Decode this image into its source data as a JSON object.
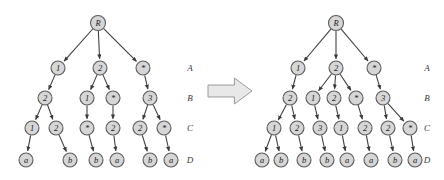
{
  "figure": {
    "type": "diagram",
    "background_color": "#ffffff",
    "node_fill_color": "#d6d6d6",
    "node_stroke_color": "#5a5a5a",
    "edge_color": "#3a3a3a",
    "arrow_fill_color": "#e8e8e8",
    "arrow_stroke_color": "#9a9a9a"
  },
  "transform_arrow": {
    "name": "rightward-block-arrow",
    "x": 208,
    "y": 78,
    "width": 44,
    "height": 26
  },
  "level_labels": {
    "labels": [
      "A",
      "B",
      "C",
      "D"
    ],
    "y": [
      68,
      98,
      128,
      160
    ],
    "left_tree_x": 190,
    "right_tree_x": 427
  },
  "left_tree": {
    "name": "original-tree",
    "nodes": [
      {
        "id": "L0",
        "label": "R",
        "x": 98,
        "y": 23,
        "r": 7.5
      },
      {
        "id": "L1",
        "label": "1",
        "x": 58,
        "y": 68,
        "r": 7
      },
      {
        "id": "L2",
        "label": "2",
        "x": 100,
        "y": 68,
        "r": 7
      },
      {
        "id": "L3",
        "label": "*",
        "x": 143,
        "y": 68,
        "r": 7
      },
      {
        "id": "L4",
        "label": "2",
        "x": 45,
        "y": 98,
        "r": 7
      },
      {
        "id": "L5",
        "label": "1",
        "x": 87,
        "y": 98,
        "r": 7
      },
      {
        "id": "L6",
        "label": "*",
        "x": 113,
        "y": 98,
        "r": 7
      },
      {
        "id": "L7",
        "label": "3",
        "x": 150,
        "y": 98,
        "r": 7
      },
      {
        "id": "L8",
        "label": "1",
        "x": 32,
        "y": 128,
        "r": 7
      },
      {
        "id": "L9",
        "label": "2",
        "x": 56,
        "y": 128,
        "r": 7
      },
      {
        "id": "L10",
        "label": "*",
        "x": 87,
        "y": 128,
        "r": 7
      },
      {
        "id": "L11",
        "label": "2",
        "x": 113,
        "y": 128,
        "r": 7
      },
      {
        "id": "L12",
        "label": "2",
        "x": 140,
        "y": 128,
        "r": 7
      },
      {
        "id": "L13",
        "label": "*",
        "x": 164,
        "y": 128,
        "r": 7
      },
      {
        "id": "L14",
        "label": "a",
        "x": 26,
        "y": 160,
        "r": 7
      },
      {
        "id": "L15",
        "label": "b",
        "x": 70,
        "y": 160,
        "r": 7
      },
      {
        "id": "L16",
        "label": "b",
        "x": 96,
        "y": 160,
        "r": 7
      },
      {
        "id": "L17",
        "label": "a",
        "x": 117,
        "y": 160,
        "r": 7
      },
      {
        "id": "L18",
        "label": "b",
        "x": 150,
        "y": 160,
        "r": 7
      },
      {
        "id": "L19",
        "label": "a",
        "x": 171,
        "y": 160,
        "r": 7
      }
    ],
    "edges": [
      {
        "from": "L0",
        "to": "L1"
      },
      {
        "from": "L0",
        "to": "L2"
      },
      {
        "from": "L0",
        "to": "L3"
      },
      {
        "from": "L1",
        "to": "L4"
      },
      {
        "from": "L2",
        "to": "L5"
      },
      {
        "from": "L2",
        "to": "L6"
      },
      {
        "from": "L3",
        "to": "L7"
      },
      {
        "from": "L4",
        "to": "L8"
      },
      {
        "from": "L4",
        "to": "L9"
      },
      {
        "from": "L5",
        "to": "L10"
      },
      {
        "from": "L6",
        "to": "L11"
      },
      {
        "from": "L7",
        "to": "L12"
      },
      {
        "from": "L7",
        "to": "L13"
      },
      {
        "from": "L8",
        "to": "L14"
      },
      {
        "from": "L9",
        "to": "L15"
      },
      {
        "from": "L10",
        "to": "L16"
      },
      {
        "from": "L11",
        "to": "L17"
      },
      {
        "from": "L12",
        "to": "L18"
      },
      {
        "from": "L13",
        "to": "L19"
      }
    ]
  },
  "right_tree": {
    "name": "transformed-tree",
    "nodes": [
      {
        "id": "R0",
        "label": "R",
        "x": 336,
        "y": 23,
        "r": 7.5
      },
      {
        "id": "R1",
        "label": "1",
        "x": 298,
        "y": 68,
        "r": 7
      },
      {
        "id": "R2",
        "label": "2",
        "x": 336,
        "y": 68,
        "r": 7
      },
      {
        "id": "R3",
        "label": "*",
        "x": 374,
        "y": 68,
        "r": 7
      },
      {
        "id": "R4",
        "label": "2",
        "x": 290,
        "y": 98,
        "r": 7
      },
      {
        "id": "R5",
        "label": "1",
        "x": 313,
        "y": 98,
        "r": 7
      },
      {
        "id": "R6",
        "label": "2",
        "x": 334,
        "y": 98,
        "r": 7
      },
      {
        "id": "R7",
        "label": "*",
        "x": 356,
        "y": 98,
        "r": 7
      },
      {
        "id": "R8",
        "label": "3",
        "x": 383,
        "y": 98,
        "r": 7
      },
      {
        "id": "R9",
        "label": "1",
        "x": 274,
        "y": 128,
        "r": 7
      },
      {
        "id": "R10",
        "label": "2",
        "x": 297,
        "y": 128,
        "r": 7
      },
      {
        "id": "R11",
        "label": "3",
        "x": 320,
        "y": 128,
        "r": 7
      },
      {
        "id": "R12",
        "label": "1",
        "x": 341,
        "y": 128,
        "r": 7
      },
      {
        "id": "R13",
        "label": "2",
        "x": 365,
        "y": 128,
        "r": 7
      },
      {
        "id": "R14",
        "label": "2",
        "x": 388,
        "y": 128,
        "r": 7
      },
      {
        "id": "R15",
        "label": "*",
        "x": 410,
        "y": 128,
        "r": 7
      },
      {
        "id": "R16",
        "label": "a",
        "x": 262,
        "y": 160,
        "r": 7
      },
      {
        "id": "R17",
        "label": "b",
        "x": 281,
        "y": 160,
        "r": 7
      },
      {
        "id": "R18",
        "label": "b",
        "x": 304,
        "y": 160,
        "r": 7
      },
      {
        "id": "R19",
        "label": "b",
        "x": 327,
        "y": 160,
        "r": 7
      },
      {
        "id": "R20",
        "label": "a",
        "x": 347,
        "y": 160,
        "r": 7
      },
      {
        "id": "R21",
        "label": "a",
        "x": 371,
        "y": 160,
        "r": 7
      },
      {
        "id": "R22",
        "label": "b",
        "x": 395,
        "y": 160,
        "r": 7
      },
      {
        "id": "R23",
        "label": "a",
        "x": 415,
        "y": 160,
        "r": 7
      }
    ],
    "edges": [
      {
        "from": "R0",
        "to": "R1"
      },
      {
        "from": "R0",
        "to": "R2"
      },
      {
        "from": "R0",
        "to": "R3"
      },
      {
        "from": "R1",
        "to": "R4"
      },
      {
        "from": "R2",
        "to": "R5"
      },
      {
        "from": "R2",
        "to": "R6"
      },
      {
        "from": "R2",
        "to": "R7"
      },
      {
        "from": "R3",
        "to": "R8"
      },
      {
        "from": "R4",
        "to": "R9"
      },
      {
        "from": "R4",
        "to": "R10"
      },
      {
        "from": "R5",
        "to": "R11"
      },
      {
        "from": "R6",
        "to": "R12"
      },
      {
        "from": "R7",
        "to": "R13"
      },
      {
        "from": "R8",
        "to": "R14"
      },
      {
        "from": "R8",
        "to": "R15"
      },
      {
        "from": "R9",
        "to": "R16"
      },
      {
        "from": "R9",
        "to": "R17"
      },
      {
        "from": "R10",
        "to": "R18"
      },
      {
        "from": "R11",
        "to": "R19"
      },
      {
        "from": "R12",
        "to": "R20"
      },
      {
        "from": "R13",
        "to": "R21"
      },
      {
        "from": "R14",
        "to": "R22"
      },
      {
        "from": "R15",
        "to": "R23"
      }
    ]
  }
}
